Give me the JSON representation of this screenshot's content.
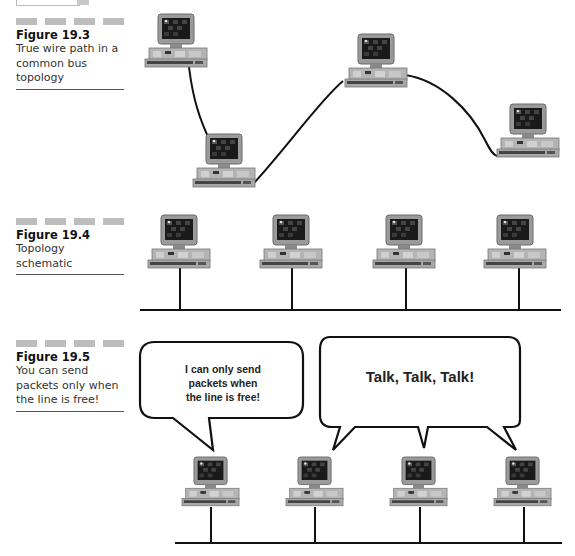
{
  "figures": [
    {
      "id": "19.3",
      "title": "Figure 19.3",
      "caption": "True wire path in a common bus topology",
      "computers": [
        {
          "x": 145,
          "y": 14
        },
        {
          "x": 193,
          "y": 134
        },
        {
          "x": 345,
          "y": 34
        },
        {
          "x": 497,
          "y": 104
        }
      ]
    },
    {
      "id": "19.4",
      "title": "Figure 19.4",
      "caption": "Topology schematic",
      "computers": [
        {
          "x": 148,
          "y": 215
        },
        {
          "x": 260,
          "y": 215
        },
        {
          "x": 373,
          "y": 215
        },
        {
          "x": 484,
          "y": 215
        }
      ],
      "bus": {
        "y": 310,
        "x1": 140,
        "x2": 561
      }
    },
    {
      "id": "19.5",
      "title": "Figure 19.5",
      "caption": "You can send packets only when the line is free!",
      "computers": [
        {
          "x": 182,
          "y": 457
        },
        {
          "x": 286,
          "y": 457
        },
        {
          "x": 390,
          "y": 457
        },
        {
          "x": 494,
          "y": 457
        }
      ],
      "bus": {
        "y": 543,
        "x1": 175,
        "x2": 562
      },
      "bubbles": [
        {
          "text": "I can only send packets when the line is free!"
        },
        {
          "text": "Talk, Talk, Talk!"
        }
      ]
    }
  ]
}
